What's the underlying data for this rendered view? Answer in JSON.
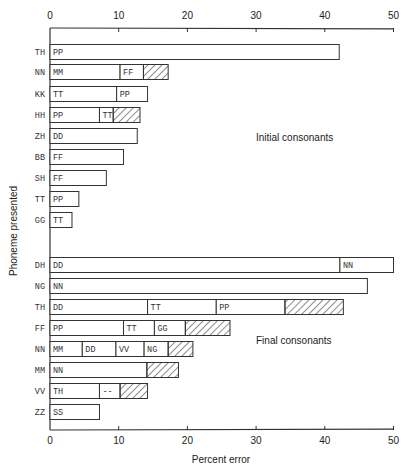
{
  "chart_data": {
    "type": "bar",
    "orientation": "horizontal",
    "stacked": true,
    "title": "",
    "xlabel": "Percent error",
    "ylabel": "Phoneme presented",
    "xlim": [
      0,
      50
    ],
    "xticks": [
      0,
      10,
      20,
      30,
      40,
      50
    ],
    "x_axis_top": true,
    "x_axis_bottom": true,
    "grid": false,
    "legend": "none",
    "hatched_segment_meaning": "other errors (hatched)",
    "groups": [
      {
        "name": "Initial consonants",
        "rows": [
          {
            "phoneme": "TH",
            "segments": [
              {
                "label": "PP",
                "end": 42.1
              }
            ]
          },
          {
            "phoneme": "NN",
            "segments": [
              {
                "label": "MM",
                "end": 10.2
              },
              {
                "label": "FF",
                "end": 13.6
              },
              {
                "label": "",
                "hatched": true,
                "end": 17.2
              }
            ]
          },
          {
            "phoneme": "KK",
            "segments": [
              {
                "label": "TT",
                "end": 9.7
              },
              {
                "label": "PP",
                "end": 14.2
              }
            ]
          },
          {
            "phoneme": "HH",
            "segments": [
              {
                "label": "PP",
                "end": 7.2
              },
              {
                "label": "TT",
                "end": 9.2
              },
              {
                "label": "",
                "hatched": true,
                "end": 13.1
              }
            ]
          },
          {
            "phoneme": "ZH",
            "segments": [
              {
                "label": "DD",
                "end": 12.7
              }
            ]
          },
          {
            "phoneme": "BB",
            "segments": [
              {
                "label": "FF",
                "end": 10.7
              }
            ]
          },
          {
            "phoneme": "SH",
            "segments": [
              {
                "label": "FF",
                "end": 8.2
              }
            ]
          },
          {
            "phoneme": "TT",
            "segments": [
              {
                "label": "PP",
                "end": 4.2
              }
            ]
          },
          {
            "phoneme": "GG",
            "segments": [
              {
                "label": "TT",
                "end": 3.2
              }
            ]
          }
        ]
      },
      {
        "name": "Final consonants",
        "rows": [
          {
            "phoneme": "DH",
            "segments": [
              {
                "label": "DD",
                "end": 42.2
              },
              {
                "label": "NN",
                "end": 50.0
              }
            ]
          },
          {
            "phoneme": "NG",
            "segments": [
              {
                "label": "NN",
                "end": 46.2
              }
            ]
          },
          {
            "phoneme": "TH",
            "segments": [
              {
                "label": "DD",
                "end": 14.2
              },
              {
                "label": "TT",
                "end": 24.2
              },
              {
                "label": "PP",
                "end": 34.2
              },
              {
                "label": "",
                "hatched": true,
                "end": 42.7
              }
            ]
          },
          {
            "phoneme": "FF",
            "segments": [
              {
                "label": "PP",
                "end": 10.7
              },
              {
                "label": "TT",
                "end": 15.2
              },
              {
                "label": "GG",
                "end": 19.7
              },
              {
                "label": "",
                "hatched": true,
                "end": 26.2
              }
            ]
          },
          {
            "phoneme": "NN",
            "segments": [
              {
                "label": "MM",
                "end": 4.7
              },
              {
                "label": "DD",
                "end": 9.6
              },
              {
                "label": "VV",
                "end": 13.7
              },
              {
                "label": "NG",
                "end": 17.2
              },
              {
                "label": "",
                "hatched": true,
                "end": 20.8
              }
            ]
          },
          {
            "phoneme": "MM",
            "segments": [
              {
                "label": "NN",
                "end": 14.1
              },
              {
                "label": "",
                "hatched": true,
                "end": 18.7
              }
            ]
          },
          {
            "phoneme": "VV",
            "segments": [
              {
                "label": "TH",
                "end": 7.2
              },
              {
                "label": "--",
                "end": 10.2
              },
              {
                "label": "",
                "hatched": true,
                "end": 14.2
              }
            ]
          },
          {
            "phoneme": "ZZ",
            "segments": [
              {
                "label": "SS",
                "end": 7.2
              }
            ]
          }
        ]
      }
    ]
  },
  "layout": {
    "x0": 50,
    "px_per_unit": 6.87,
    "top_axis_y": 28,
    "bottom_axis_y": 430,
    "bar_height": 15,
    "row_centers": {
      "Initial consonants": [
        52,
        72,
        94,
        115,
        136,
        157,
        178,
        199,
        220
      ],
      "Final consonants": [
        265,
        286,
        307,
        328,
        349,
        370,
        391,
        412
      ]
    },
    "group_title_pos": {
      "Initial consonants": [
        256,
        141
      ],
      "Final consonants": [
        256,
        344
      ]
    },
    "colors": {
      "line": "#333333",
      "fill": "#ffffff",
      "text": "#222222",
      "hatch": "#333333"
    }
  }
}
